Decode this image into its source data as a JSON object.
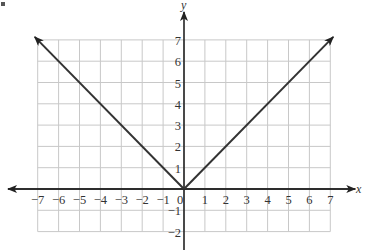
{
  "figure": {
    "marker": "•",
    "x_axis_label": "x",
    "y_axis_label": "y",
    "colors": {
      "grid": "#c8c8c8",
      "axis": "#222222",
      "curve": "#333333",
      "text": "#333333"
    }
  },
  "chart_data": {
    "type": "line",
    "title": "",
    "xlabel": "x",
    "ylabel": "y",
    "xlim": [
      -7,
      7
    ],
    "ylim": [
      -2,
      7
    ],
    "grid": true,
    "x_ticks": [
      "-7",
      "-6",
      "-5",
      "-4",
      "-3",
      "-2",
      "-1",
      "0",
      "1",
      "2",
      "3",
      "4",
      "5",
      "6",
      "7"
    ],
    "y_ticks": [
      "7",
      "6",
      "5",
      "4",
      "3",
      "2",
      "1",
      "-1",
      "-2"
    ],
    "series": [
      {
        "name": "y = |x|",
        "x": [
          -7,
          0,
          7
        ],
        "y": [
          7,
          0,
          7
        ],
        "arrows_at_ends": true
      }
    ],
    "legend": null
  }
}
